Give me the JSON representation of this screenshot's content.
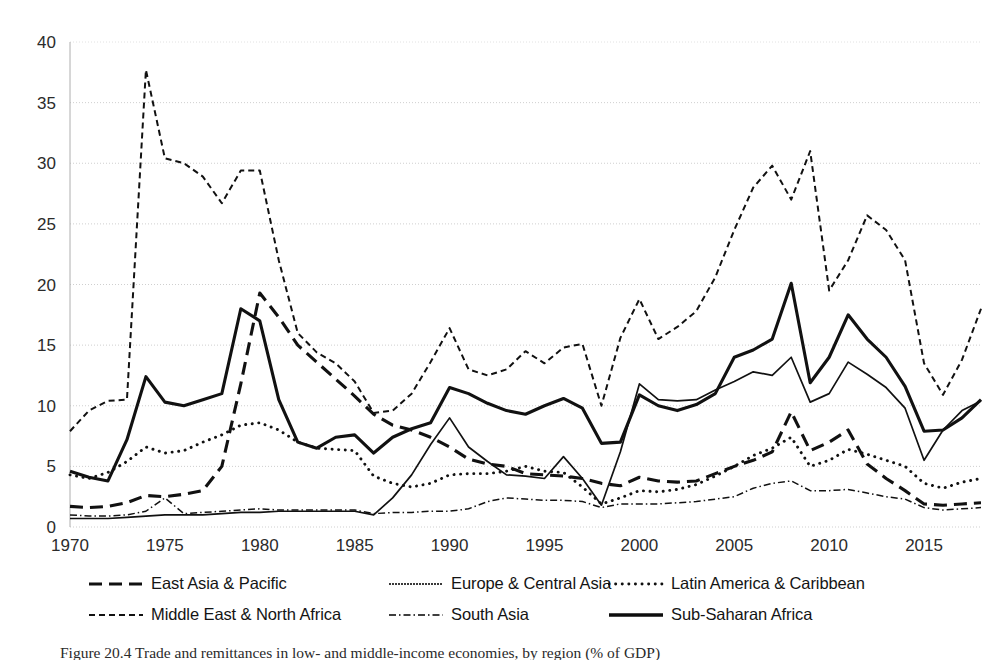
{
  "figure": {
    "caption": "Figure 20.4   Trade and remittances in low- and middle-income economies, by region (% of GDP)"
  },
  "chart_data": {
    "type": "line",
    "title": "",
    "xlabel": "",
    "ylabel": "",
    "xlim": [
      1970,
      2018
    ],
    "ylim": [
      0,
      40
    ],
    "grid": true,
    "legend_position": "bottom",
    "y_ticks": [
      0,
      5,
      10,
      15,
      20,
      25,
      30,
      35,
      40
    ],
    "x_ticks": [
      1970,
      1975,
      1980,
      1985,
      1990,
      1995,
      2000,
      2005,
      2010,
      2015
    ],
    "x": [
      1970,
      1971,
      1972,
      1973,
      1974,
      1975,
      1976,
      1977,
      1978,
      1979,
      1980,
      1981,
      1982,
      1983,
      1984,
      1985,
      1986,
      1987,
      1988,
      1989,
      1990,
      1991,
      1992,
      1993,
      1994,
      1995,
      1996,
      1997,
      1998,
      1999,
      2000,
      2001,
      2002,
      2003,
      2004,
      2005,
      2006,
      2007,
      2008,
      2009,
      2010,
      2011,
      2012,
      2013,
      2014,
      2015,
      2016,
      2017,
      2018
    ],
    "series": [
      {
        "name": "East Asia & Pacific",
        "style": "long-dash",
        "color": "#111111",
        "width": 3.1,
        "dasharray": "13 7",
        "values": [
          1.7,
          1.6,
          1.7,
          2.0,
          2.6,
          2.5,
          2.7,
          3.0,
          5.0,
          11.8,
          19.3,
          17.3,
          15.0,
          13.6,
          12.2,
          10.8,
          9.3,
          8.4,
          8.0,
          7.4,
          6.6,
          5.6,
          5.2,
          5.0,
          4.4,
          4.3,
          4.2,
          4.0,
          3.6,
          3.4,
          4.1,
          3.8,
          3.7,
          3.8,
          4.4,
          5.0,
          5.5,
          6.2,
          9.5,
          6.3,
          7.0,
          8.0,
          5.2,
          4.0,
          3.0,
          1.9,
          1.8,
          1.9,
          2.0
        ]
      },
      {
        "name": "Europe & Central Asia",
        "style": "thin-solid",
        "color": "#3a3a3a",
        "width": 1.7,
        "dasharray": "",
        "values": [
          0.7,
          0.7,
          0.7,
          0.8,
          0.9,
          1.0,
          1.0,
          1.0,
          1.1,
          1.2,
          1.2,
          1.3,
          1.3,
          1.3,
          1.3,
          1.3,
          1.0,
          2.4,
          4.3,
          6.8,
          9.0,
          6.6,
          5.4,
          4.3,
          4.2,
          4.0,
          5.8,
          4.0,
          1.8,
          6.2,
          11.8,
          10.5,
          10.4,
          10.5,
          11.3,
          12.0,
          12.8,
          12.5,
          14.0,
          10.3,
          11.0,
          13.6,
          12.6,
          11.5,
          9.8,
          5.5,
          8.0,
          9.6,
          10.4
        ]
      },
      {
        "name": "Latin America & Caribbean",
        "style": "dotted",
        "color": "#111111",
        "width": 2.9,
        "dasharray": "0.1 6.5",
        "values": [
          4.3,
          4.0,
          4.5,
          5.4,
          6.6,
          6.1,
          6.3,
          7.0,
          7.6,
          8.4,
          8.6,
          8.0,
          7.0,
          6.5,
          6.4,
          6.3,
          4.2,
          3.6,
          3.3,
          3.6,
          4.3,
          4.4,
          4.4,
          4.6,
          5.0,
          4.6,
          4.5,
          3.3,
          1.9,
          2.4,
          3.0,
          2.9,
          3.1,
          3.5,
          4.2,
          5.0,
          5.9,
          6.5,
          7.4,
          5.0,
          5.5,
          6.4,
          6.0,
          5.5,
          5.0,
          3.6,
          3.2,
          3.7,
          4.0
        ]
      },
      {
        "name": "Middle East & North Africa",
        "style": "short-dash",
        "color": "#111111",
        "width": 2.0,
        "dasharray": "6 4",
        "values": [
          7.9,
          9.6,
          10.4,
          10.5,
          37.7,
          30.4,
          30.0,
          28.9,
          26.7,
          29.4,
          29.4,
          22.0,
          16.0,
          14.4,
          13.5,
          12.0,
          9.4,
          9.6,
          11.0,
          13.6,
          16.4,
          13.0,
          12.5,
          13.0,
          14.5,
          13.5,
          14.8,
          15.1,
          10.0,
          15.6,
          18.8,
          15.5,
          16.5,
          17.8,
          20.6,
          24.5,
          28.0,
          29.8,
          27.0,
          31.0,
          19.5,
          22.0,
          25.7,
          24.5,
          22.0,
          13.5,
          10.9,
          13.8,
          18.0
        ]
      },
      {
        "name": "South Asia",
        "style": "thin-dashdot",
        "color": "#3f3f3f",
        "width": 1.5,
        "dasharray": "7 3 1.5 3",
        "values": [
          1.0,
          0.9,
          0.9,
          1.0,
          1.3,
          2.4,
          1.1,
          1.2,
          1.3,
          1.4,
          1.5,
          1.4,
          1.4,
          1.4,
          1.4,
          1.4,
          1.1,
          1.2,
          1.2,
          1.3,
          1.3,
          1.5,
          2.1,
          2.4,
          2.3,
          2.2,
          2.2,
          2.1,
          1.6,
          1.9,
          1.9,
          1.9,
          2.0,
          2.1,
          2.3,
          2.5,
          3.2,
          3.6,
          3.8,
          3.0,
          3.0,
          3.1,
          2.8,
          2.5,
          2.3,
          1.6,
          1.4,
          1.5,
          1.6
        ]
      },
      {
        "name": "Sub-Saharan Africa",
        "style": "thick-solid",
        "color": "#0d0d0d",
        "width": 3.1,
        "dasharray": "",
        "values": [
          4.6,
          4.1,
          3.8,
          7.2,
          12.4,
          10.3,
          10.0,
          10.5,
          11.0,
          18.0,
          17.0,
          10.5,
          7.0,
          6.5,
          7.4,
          7.6,
          6.1,
          7.4,
          8.1,
          8.6,
          11.5,
          11.0,
          10.2,
          9.6,
          9.3,
          10.0,
          10.6,
          9.8,
          6.9,
          7.0,
          10.9,
          10.0,
          9.6,
          10.1,
          11.0,
          14.0,
          14.6,
          15.5,
          20.1,
          11.9,
          14.0,
          17.5,
          15.5,
          14.0,
          11.6,
          7.9,
          8.0,
          9.0,
          10.5
        ]
      }
    ]
  },
  "legend": {
    "rows": [
      [
        {
          "label": "East Asia & Pacific",
          "swatch": "long-dash"
        },
        {
          "label": "Europe & Central Asia",
          "swatch": "thin-solid"
        },
        {
          "label": "Latin America & Caribbean",
          "swatch": "dotted"
        }
      ],
      [
        {
          "label": "Middle East & North Africa",
          "swatch": "short-dash"
        },
        {
          "label": "South Asia",
          "swatch": "thin-dashdot"
        },
        {
          "label": "Sub-Saharan Africa",
          "swatch": "thick-solid"
        }
      ]
    ]
  }
}
